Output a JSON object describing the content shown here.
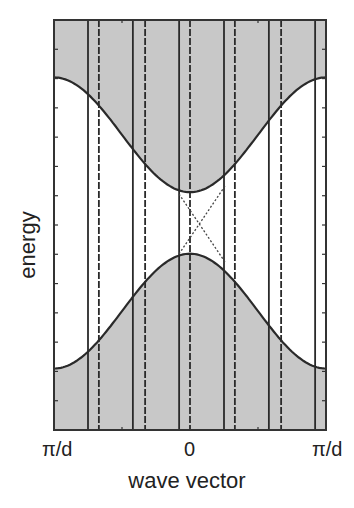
{
  "chart_data": {
    "type": "line",
    "title": "",
    "xlabel": "wave vector",
    "ylabel": "energy",
    "x_tick_labels": [
      "π/d",
      "0",
      "π/d"
    ],
    "x_range": [
      -1,
      1
    ],
    "y_range": [
      0,
      1
    ],
    "grid": false,
    "legend": null,
    "series": [
      {
        "name": "upper band edge",
        "style": "solid",
        "x": [
          -1,
          -0.75,
          -0.5,
          -0.25,
          0,
          0.25,
          0.5,
          0.75,
          1
        ],
        "y": [
          0.86,
          0.79,
          0.62,
          0.45,
          0.58,
          0.45,
          0.62,
          0.79,
          0.86
        ]
      },
      {
        "name": "lower band edge",
        "style": "solid",
        "x": [
          -1,
          -0.75,
          -0.5,
          -0.25,
          0,
          0.25,
          0.5,
          0.75,
          1
        ],
        "y": [
          0.15,
          0.22,
          0.38,
          0.53,
          0.43,
          0.53,
          0.38,
          0.22,
          0.15
        ]
      },
      {
        "name": "crossing mode A",
        "style": "dotted",
        "x": [
          -0.08,
          0.25
        ],
        "y": [
          0.42,
          0.59
        ]
      },
      {
        "name": "crossing mode B",
        "style": "dotted",
        "x": [
          -0.08,
          0.25
        ],
        "y": [
          0.59,
          0.42
        ]
      }
    ],
    "upper_band": {
      "edge_value": 0.86,
      "center_value": 0.58,
      "fill": "gray, above curve"
    },
    "lower_band": {
      "edge_value": 0.15,
      "center_value": 0.43,
      "fill": "gray, below curve"
    },
    "vertical_lines": {
      "solid_x": [
        -0.75,
        -0.42,
        -0.08,
        0.25,
        0.58,
        0.92
      ],
      "dashed_x": [
        -0.67,
        -0.33,
        0.0,
        0.33,
        0.67
      ]
    },
    "colors": {
      "band_fill": "#c8c8c8",
      "line": "#2a2a2a",
      "frame": "#333333"
    }
  },
  "labels": {
    "ylabel": "energy",
    "xlabel": "wave vector",
    "xtick_left": "π/d",
    "xtick_center": "0",
    "xtick_right": "π/d"
  }
}
